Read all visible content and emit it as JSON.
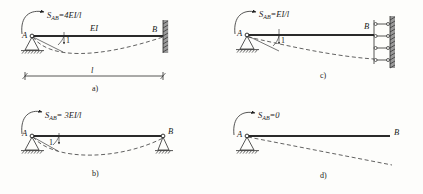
{
  "figure": {
    "title_present": false,
    "background_color": "#fdfdfb",
    "ink_color": "#1a1a1a",
    "panel_count": 4
  },
  "panels": [
    {
      "id": "a",
      "caption": "a)",
      "moment_label": "S",
      "moment_subscript": "AB",
      "moment_equals": "=4EI/l",
      "moment_full": "S_AB=4EI/l",
      "beam_label": "EI",
      "node_left": "A",
      "node_right": "B",
      "unit_rotation_label": "1",
      "span_label": "l",
      "support_left": "pin",
      "support_right": "fixed-wall",
      "has_span_dimension": true,
      "deflection": "sagging-curve"
    },
    {
      "id": "b",
      "caption": "b)",
      "moment_label": "S",
      "moment_subscript": "AB",
      "moment_equals": "= 3EI/l",
      "moment_full": "S_AB= 3EI/l",
      "beam_label": "",
      "node_left": "A",
      "node_right": "B",
      "unit_rotation_label": "1",
      "span_label": "",
      "support_left": "pin",
      "support_right": "pin",
      "has_span_dimension": false,
      "deflection": "sagging-curve"
    },
    {
      "id": "c",
      "caption": "c)",
      "moment_label": "S",
      "moment_subscript": "AB",
      "moment_equals": "=EI/l",
      "moment_full": "S_AB=EI/l",
      "beam_label": "",
      "node_left": "A",
      "node_right": "B",
      "unit_rotation_label": "1",
      "span_label": "",
      "support_left": "pin",
      "support_right": "guided-links-wall",
      "link_count": 4,
      "has_span_dimension": false,
      "deflection": "downward-curve"
    },
    {
      "id": "d",
      "caption": "d)",
      "moment_label": "S",
      "moment_subscript": "AB",
      "moment_equals": "=0",
      "moment_full": "S_AB=0",
      "beam_label": "",
      "node_left": "A",
      "node_right": "B",
      "unit_rotation_label": "",
      "span_label": "",
      "support_left": "pin",
      "support_right": "free",
      "has_span_dimension": false,
      "deflection": "straight-slope"
    }
  ]
}
